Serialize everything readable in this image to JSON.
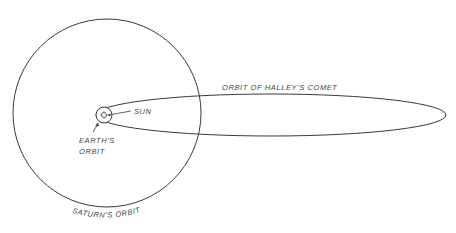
{
  "diagram": {
    "colors": {
      "stroke": "#3a3a3a",
      "text": "#444444",
      "background": "#ffffff"
    },
    "saturn_orbit": {
      "cx": 107,
      "cy": 113,
      "r": 94,
      "label": "SATURN'S ORBIT"
    },
    "halley_orbit": {
      "cx": 271,
      "cy": 115,
      "rx": 175,
      "ry": 21,
      "label": "ORBIT OF HALLEY'S COMET"
    },
    "earth_orbit": {
      "cx": 104,
      "cy": 115,
      "r": 8,
      "label_line1": "EARTH'S",
      "label_line2": "ORBIT"
    },
    "sun": {
      "cx": 104,
      "cy": 115,
      "r": 2.5,
      "label": "SUN"
    },
    "earth": {
      "cx": 109.5,
      "cy": 115,
      "r": 1.2
    }
  }
}
